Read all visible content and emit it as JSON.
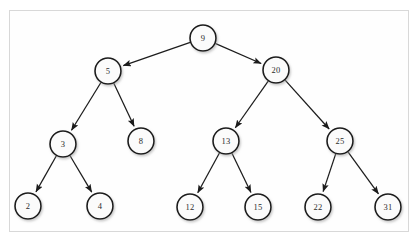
{
  "figure": {
    "background_color": "#ffffff",
    "frame_color": "#d8d8d8",
    "node_fill_color": "#fbfbfb",
    "node_stroke_color": "#1a1a1a",
    "edge_color": "#1c1c1c",
    "label_color": "#2b2b2b"
  },
  "chart_data": {
    "type": "diagram",
    "diagram_kind": "binary-search-tree",
    "node_radius": 13,
    "nodes": [
      {
        "id": "n9",
        "label": "9",
        "x": 203,
        "y": 38,
        "level": 0
      },
      {
        "id": "n5",
        "label": "5",
        "x": 108,
        "y": 71,
        "level": 1
      },
      {
        "id": "n20",
        "label": "20",
        "x": 276,
        "y": 70,
        "level": 1
      },
      {
        "id": "n3",
        "label": "3",
        "x": 63,
        "y": 144,
        "level": 2
      },
      {
        "id": "n8",
        "label": "8",
        "x": 141,
        "y": 141,
        "level": 2
      },
      {
        "id": "n13",
        "label": "13",
        "x": 226,
        "y": 141,
        "level": 2
      },
      {
        "id": "n25",
        "label": "25",
        "x": 340,
        "y": 141,
        "level": 2
      },
      {
        "id": "n2",
        "label": "2",
        "x": 28,
        "y": 206,
        "level": 3
      },
      {
        "id": "n4",
        "label": "4",
        "x": 100,
        "y": 206,
        "level": 3
      },
      {
        "id": "n12",
        "label": "12",
        "x": 190,
        "y": 207,
        "level": 3
      },
      {
        "id": "n15",
        "label": "15",
        "x": 258,
        "y": 207,
        "level": 3
      },
      {
        "id": "n22",
        "label": "22",
        "x": 318,
        "y": 207,
        "level": 3
      },
      {
        "id": "n31",
        "label": "31",
        "x": 388,
        "y": 207,
        "level": 3
      }
    ],
    "edges": [
      {
        "from": "n9",
        "to": "n5",
        "side": "left",
        "directed": true
      },
      {
        "from": "n9",
        "to": "n20",
        "side": "right",
        "directed": true
      },
      {
        "from": "n5",
        "to": "n3",
        "side": "left",
        "directed": true
      },
      {
        "from": "n5",
        "to": "n8",
        "side": "right",
        "directed": true
      },
      {
        "from": "n20",
        "to": "n13",
        "side": "left",
        "directed": true
      },
      {
        "from": "n20",
        "to": "n25",
        "side": "right",
        "directed": true
      },
      {
        "from": "n3",
        "to": "n2",
        "side": "left",
        "directed": true
      },
      {
        "from": "n3",
        "to": "n4",
        "side": "right",
        "directed": true
      },
      {
        "from": "n13",
        "to": "n12",
        "side": "left",
        "directed": true
      },
      {
        "from": "n13",
        "to": "n15",
        "side": "right",
        "directed": true
      },
      {
        "from": "n25",
        "to": "n22",
        "side": "left",
        "directed": true
      },
      {
        "from": "n25",
        "to": "n31",
        "side": "right",
        "directed": true
      }
    ]
  }
}
